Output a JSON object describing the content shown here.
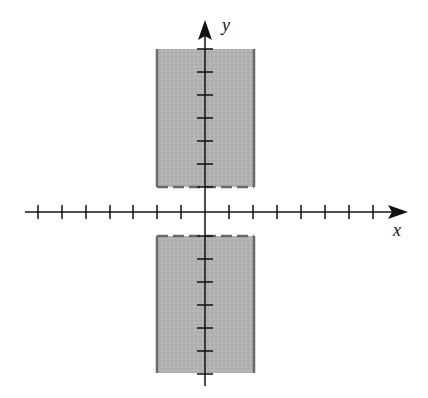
{
  "figure": {
    "type": "coordinate-plane-region",
    "x_axis_label": "x",
    "y_axis_label": "y",
    "tick_spacing_units": 1,
    "x_ticks": [
      -7,
      -6,
      -5,
      -4,
      -3,
      -2,
      -1,
      1,
      2,
      3,
      4,
      5,
      6,
      7
    ],
    "y_ticks": [
      -7,
      -6,
      -5,
      -4,
      -3,
      -2,
      -1,
      1,
      2,
      3,
      4,
      5,
      6,
      7
    ],
    "regions": [
      {
        "name": "upper",
        "x_min": -2,
        "x_max": 2,
        "y_min": 1,
        "y_max": 7,
        "side_edges": "solid",
        "inner_edge": "dashed",
        "fill": "#b0b0b0"
      },
      {
        "name": "lower",
        "x_min": -2,
        "x_max": 2,
        "y_min": -7,
        "y_max": -1,
        "side_edges": "solid",
        "inner_edge": "dashed",
        "fill": "#b0b0b0"
      }
    ]
  },
  "colors": {
    "fill": "#b0b0b0",
    "edge": "#6a6a6a",
    "axis": "#111111"
  }
}
